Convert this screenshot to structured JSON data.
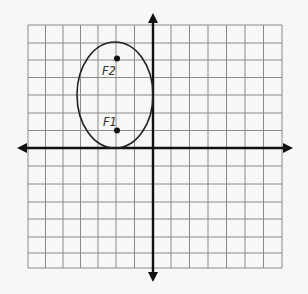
{
  "diagram": {
    "title": "",
    "grid": {
      "x_range": [
        -7,
        7
      ],
      "y_range": [
        -7,
        7
      ],
      "cell_px": 17.8,
      "origin_px": [
        153,
        148
      ]
    },
    "ellipse": {
      "center": [
        -2,
        3
      ],
      "semi_major_vertical": 3,
      "semi_minor_horizontal": 2.1
    },
    "foci": [
      {
        "label": "F1",
        "point": [
          -2,
          1
        ]
      },
      {
        "label": "F2",
        "point": [
          -2,
          5
        ]
      }
    ],
    "colors": {
      "background": "#f7f7f5",
      "grid": "#8a8a8a",
      "axis": "#111111",
      "curve": "#222222"
    }
  }
}
